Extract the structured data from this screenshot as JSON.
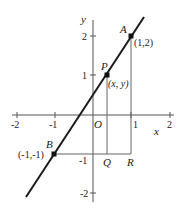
{
  "figure": {
    "type": "coordinate-geometry-diagram",
    "axes": {
      "x_label": "x",
      "y_label": "y",
      "origin_label": "O",
      "x_ticks": [
        "-2",
        "-1",
        "1",
        "2"
      ],
      "y_ticks": [
        "2",
        "1",
        "-1",
        "-2"
      ]
    },
    "points": {
      "A": {
        "name": "A",
        "coord_label": "(1,2)",
        "x": 1,
        "y": 2
      },
      "B": {
        "name": "B",
        "coord_label": "(-1,-1)",
        "x": -1,
        "y": -1
      },
      "P": {
        "name": "P",
        "coord_label": "(x, y)",
        "x": 0.37,
        "y": 1
      },
      "Q": {
        "name": "Q"
      },
      "R": {
        "name": "R"
      }
    },
    "colors": {
      "line": "#1a1a1a",
      "axes": "#555555",
      "guides": "#666666",
      "text": "#222222"
    }
  }
}
